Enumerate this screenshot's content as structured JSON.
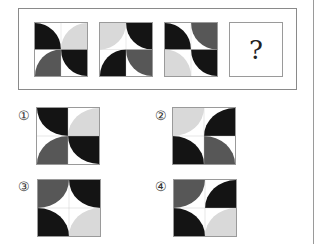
{
  "colors": {
    "black": "#141414",
    "dark": "#575757",
    "light": "#d9d9d9",
    "white": "#ffffff"
  },
  "question": {
    "figures": [
      {
        "id": "fig-1",
        "quads": [
          {
            "c": "black",
            "ctr": "bl"
          },
          {
            "c": "light",
            "ctr": "br"
          },
          {
            "c": "dark",
            "ctr": "br"
          },
          {
            "c": "black",
            "ctr": "tr"
          }
        ]
      },
      {
        "id": "fig-2",
        "quads": [
          {
            "c": "light",
            "ctr": "tl"
          },
          {
            "c": "black",
            "ctr": "tr"
          },
          {
            "c": "black",
            "ctr": "br"
          },
          {
            "c": "dark",
            "ctr": "tr"
          }
        ]
      },
      {
        "id": "fig-3",
        "quads": [
          {
            "c": "black",
            "ctr": "bl"
          },
          {
            "c": "dark",
            "ctr": "tr"
          },
          {
            "c": "light",
            "ctr": "bl"
          },
          {
            "c": "black",
            "ctr": "tr"
          }
        ]
      }
    ],
    "unknown_label": "?"
  },
  "options": [
    {
      "label": "①",
      "quads": [
        {
          "c": "black",
          "ctr": "tr"
        },
        {
          "c": "light",
          "ctr": "br"
        },
        {
          "c": "dark",
          "ctr": "br"
        },
        {
          "c": "black",
          "ctr": "tr"
        }
      ]
    },
    {
      "label": "②",
      "quads": [
        {
          "c": "light",
          "ctr": "tl"
        },
        {
          "c": "black",
          "ctr": "br"
        },
        {
          "c": "black",
          "ctr": "bl"
        },
        {
          "c": "dark",
          "ctr": "bl"
        }
      ]
    },
    {
      "label": "③",
      "quads": [
        {
          "c": "dark",
          "ctr": "tl"
        },
        {
          "c": "black",
          "ctr": "tr"
        },
        {
          "c": "black",
          "ctr": "bl"
        },
        {
          "c": "light",
          "ctr": "br"
        }
      ]
    },
    {
      "label": "④",
      "quads": [
        {
          "c": "dark",
          "ctr": "tl"
        },
        {
          "c": "black",
          "ctr": "br"
        },
        {
          "c": "black",
          "ctr": "bl"
        },
        {
          "c": "light",
          "ctr": "br"
        }
      ]
    }
  ]
}
